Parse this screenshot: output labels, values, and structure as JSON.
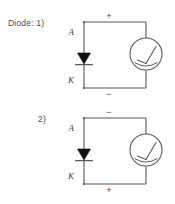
{
  "figure": {
    "title_label": "Diode:",
    "background_color": "#ffffff",
    "line_color": "#58595b",
    "diode_fill_color": "#111111",
    "text_color": "#4a4a4a"
  },
  "circuits": [
    {
      "index_label": "1)",
      "prefix_label": "Diode: 1)",
      "anode_label": "A",
      "cathode_label": "K",
      "top_terminal_sign": "+",
      "bottom_terminal_sign": "−",
      "diode_orientation": "cathode-down",
      "meter_name": "analog-meter"
    },
    {
      "index_label": "2)",
      "prefix_label": "2)",
      "anode_label": "A",
      "cathode_label": "K",
      "top_terminal_sign": "−",
      "bottom_terminal_sign": "+",
      "diode_orientation": "cathode-down",
      "meter_name": "analog-meter"
    }
  ]
}
